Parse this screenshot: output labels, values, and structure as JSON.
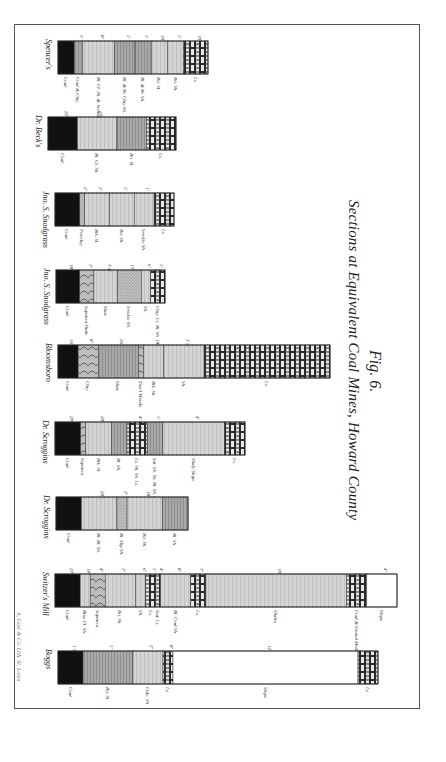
{
  "figure": {
    "number": "Fig. 6.",
    "title": "Sections at Equivalent Coal Mines, Howard County",
    "credit": "A. Gast & Co. Lith. St. Louis"
  },
  "legend_patterns": {
    "coal": "solid black",
    "limestone": "brick blocks",
    "shale": "fine horizontal lines",
    "sandstone": "stippled",
    "clay": "curved strokes",
    "slope": "blank"
  },
  "colors": {
    "ink": "#1a1a1a",
    "paper": "#ffffff",
    "frame": "#555555"
  },
  "sections": [
    {
      "name": "Spencer's",
      "layers": [
        {
          "type": "coal",
          "label": "Coal.",
          "thickness": "",
          "rel": 4
        },
        {
          "type": "shale-dark",
          "label": "Coal & Clay",
          "thickness": "3'",
          "rel": 2
        },
        {
          "type": "shale",
          "label": "Bl. Cl. Sh. & Arshaldagon",
          "thickness": "8'",
          "rel": 8
        },
        {
          "type": "shale-dark",
          "label": "Bl. & Br. Clay Sh.",
          "thickness": "5'",
          "rel": 5
        },
        {
          "type": "shale-dark",
          "label": "Bl. & Br. Sh.",
          "thickness": "5'",
          "rel": 4
        },
        {
          "type": "shale",
          "label": "Bit. Sl.",
          "thickness": "10'",
          "rel": 4
        },
        {
          "type": "shale",
          "label": "Bit. Sh.",
          "thickness": "5'",
          "rel": 4
        },
        {
          "type": "limestone",
          "label": "Ls.",
          "thickness": "10'",
          "rel": 6
        }
      ]
    },
    {
      "name": "Dr. Beck's",
      "layers": [
        {
          "type": "coal",
          "label": "Coal.",
          "thickness": "22'",
          "rel": 6
        },
        {
          "type": "shale",
          "label": "Bl. Cl. Sh.",
          "thickness": "27'",
          "rel": 8
        },
        {
          "type": "shale-dark",
          "label": "Bit. Sl.",
          "thickness": "",
          "rel": 6
        },
        {
          "type": "limestone",
          "label": "Ls.",
          "thickness": "",
          "rel": 6
        }
      ]
    },
    {
      "name": "Jno. S. Snodgrass",
      "layers": [
        {
          "type": "coal",
          "label": "Coal.",
          "thickness": "",
          "rel": 5
        },
        {
          "type": "sandstone",
          "label": "Fireclay",
          "thickness": "2'",
          "rel": 1
        },
        {
          "type": "shale",
          "label": "Blk. Sl.",
          "thickness": "3'",
          "rel": 5
        },
        {
          "type": "shale",
          "label": "Bit. Sh.",
          "thickness": "5'",
          "rel": 5
        },
        {
          "type": "shale",
          "label": "Smokie Sh.",
          "thickness": "1'",
          "rel": 4
        },
        {
          "type": "limestone",
          "label": "Ls.",
          "thickness": "",
          "rel": 4
        }
      ]
    },
    {
      "name": "Jno. S. Snodgrass",
      "layers": [
        {
          "type": "coal",
          "label": "Coal.",
          "thickness": "18'",
          "rel": 5
        },
        {
          "type": "clay",
          "label": "Septaria Shale",
          "thickness": "7'",
          "rel": 3
        },
        {
          "type": "shale",
          "label": "Slate",
          "thickness": "7.4'",
          "rel": 5
        },
        {
          "type": "sandstone",
          "label": "Smokie Sh.",
          "thickness": "13'",
          "rel": 5
        },
        {
          "type": "shale",
          "label": "Sh.",
          "thickness": "6'",
          "rel": 2
        },
        {
          "type": "limestone",
          "label": "Clay. Ls. Bl. Sh.",
          "thickness": "5'",
          "rel": 3
        }
      ]
    },
    {
      "name": "Bloomsboro",
      "layers": [
        {
          "type": "coal",
          "label": "Coal",
          "thickness": "16'",
          "rel": 4
        },
        {
          "type": "clay",
          "label": "Clay",
          "thickness": "8'",
          "rel": 4
        },
        {
          "type": "shale-dark",
          "label": "Slate",
          "thickness": "26'",
          "rel": 8
        },
        {
          "type": "clay",
          "label": "Dun'l Mouds",
          "thickness": "",
          "rel": 1
        },
        {
          "type": "shale",
          "label": "Blk. Sh.",
          "thickness": "19'",
          "rel": 4
        },
        {
          "type": "shale",
          "label": "Sh.",
          "thickness": "7.5'",
          "rel": 8
        },
        {
          "type": "limestone",
          "label": "Ls.",
          "thickness": "",
          "rel": 25
        }
      ]
    },
    {
      "name": "Dr. Scroggins",
      "layers": [
        {
          "type": "coal",
          "label": "Coal",
          "thickness": "20'",
          "rel": 5
        },
        {
          "type": "clay",
          "label": "Septaria",
          "thickness": "",
          "rel": 1
        },
        {
          "type": "shale",
          "label": "Blk. Sl.",
          "thickness": "24'",
          "rel": 5
        },
        {
          "type": "shale-dark",
          "label": "Bl. Sh.",
          "thickness": "",
          "rel": 3
        },
        {
          "type": "limestone",
          "label": "Ls. Sh. Sh. Ls.",
          "thickness": "4' 4' 4'",
          "rel": 4
        },
        {
          "type": "shale-dark",
          "label": "Sal. Sb. Sh. Bl. Sh. Calc. Sh.",
          "thickness": "5'",
          "rel": 3
        },
        {
          "type": "shale",
          "label": "Shaly Slope",
          "thickness": "4'",
          "rel": 12
        },
        {
          "type": "limestone",
          "label": "Ls.",
          "thickness": "",
          "rel": 4
        }
      ]
    },
    {
      "name": "Dr. Scroggins",
      "layers": [
        {
          "type": "coal",
          "label": "Coal",
          "thickness": "",
          "rel": 5
        },
        {
          "type": "shale",
          "label": "Bl. Bl. Sh.",
          "thickness": "24'",
          "rel": 7
        },
        {
          "type": "sandstone",
          "label": "Bl. Slip Sh.",
          "thickness": "7'",
          "rel": 2
        },
        {
          "type": "shale",
          "label": "Bit. Sh.",
          "thickness": "18'",
          "rel": 7
        },
        {
          "type": "shale-dark",
          "label": "Bl. Sh.",
          "thickness": "",
          "rel": 5
        }
      ]
    },
    {
      "name": "Switzer's Mill",
      "layers": [
        {
          "type": "coal",
          "label": "Coal",
          "thickness": "27'",
          "rel": 5
        },
        {
          "type": "shale",
          "label": "Blue Cl. Sh.",
          "thickness": "10'",
          "rel": 2
        },
        {
          "type": "clay",
          "label": "Septaria",
          "thickness": "4'",
          "rel": 3
        },
        {
          "type": "shale",
          "label": "Bit. Sh.",
          "thickness": "7'",
          "rel": 6
        },
        {
          "type": "shale",
          "label": "Sh.",
          "thickness": "6'",
          "rel": 2
        },
        {
          "type": "limestone",
          "label": "Ls.",
          "thickness": "5'",
          "rel": 2
        },
        {
          "type": "limestone",
          "label": "Sed. Ls.",
          "thickness": "4'",
          "rel": 1
        },
        {
          "type": "shale",
          "label": "Bl. Coal Sh.",
          "thickness": "8'",
          "rel": 6
        },
        {
          "type": "limestone",
          "label": "Ls.",
          "thickness": "7'",
          "rel": 3
        },
        {
          "type": "shale",
          "label": "Shales",
          "thickness": "10'",
          "rel": 28
        },
        {
          "type": "limestone",
          "label": "Coal & Sinned Mod. Ls.",
          "thickness": "",
          "rel": 4
        },
        {
          "type": "slope",
          "label": "Slope",
          "thickness": "4'",
          "rel": 6
        }
      ]
    },
    {
      "name": "Boggs",
      "layers": [
        {
          "type": "coal",
          "label": "Coal",
          "thickness": "1.5'",
          "rel": 5
        },
        {
          "type": "shale-dark",
          "label": "Bit. Sl.",
          "thickness": "5'",
          "rel": 10
        },
        {
          "type": "shale",
          "label": "Calc. Sh.",
          "thickness": "2'",
          "rel": 6
        },
        {
          "type": "limestone",
          "label": "Ls.",
          "thickness": "8'",
          "rel": 2
        },
        {
          "type": "slope",
          "label": "Slope",
          "thickness": "12'",
          "rel": 37
        },
        {
          "type": "limestone",
          "label": "Ls.",
          "thickness": "",
          "rel": 4
        }
      ]
    }
  ]
}
